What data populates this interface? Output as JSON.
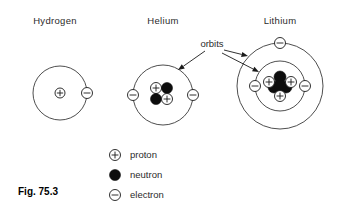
{
  "figure": {
    "caption": "Fig. 75.3",
    "orbits_label": "orbits",
    "width": 339,
    "height": 213,
    "colors": {
      "background": "#ffffff",
      "stroke": "#1a1a1a",
      "orbit_stroke": "#3a3a3a",
      "neutron_fill": "#0d0d0d",
      "proton_fill": "#ffffff",
      "electron_fill": "#ffffff",
      "text": "#2b2b2b"
    }
  },
  "atoms": [
    {
      "name": "hydrogen",
      "title": "Hydrogen",
      "title_x": 55,
      "title_y": 24,
      "center": {
        "x": 60,
        "y": 93
      },
      "orbits": [
        {
          "radius": 27
        }
      ],
      "protons": 1,
      "neutrons": 0,
      "electrons": 1,
      "nucleus_particles": [
        {
          "type": "proton",
          "dx": 0,
          "dy": 0,
          "r": 5
        }
      ],
      "electron_positions": [
        {
          "x": 87,
          "y": 93,
          "r": 5.5
        }
      ]
    },
    {
      "name": "helium",
      "title": "Helium",
      "title_x": 163,
      "title_y": 24,
      "center": {
        "x": 163,
        "y": 95
      },
      "orbits": [
        {
          "radius": 30
        }
      ],
      "protons": 2,
      "neutrons": 2,
      "electrons": 2,
      "nucleus_particles": [
        {
          "type": "proton",
          "dx": -7,
          "dy": -7,
          "r": 5.5
        },
        {
          "type": "neutron",
          "dx": 4,
          "dy": -7,
          "r": 5.5
        },
        {
          "type": "neutron",
          "dx": -7,
          "dy": 4,
          "r": 5.5
        },
        {
          "type": "proton",
          "dx": 4,
          "dy": 4,
          "r": 5.5
        }
      ],
      "electron_positions": [
        {
          "x": 133,
          "y": 95,
          "r": 5.5
        },
        {
          "x": 193,
          "y": 95,
          "r": 5.5
        }
      ]
    },
    {
      "name": "lithium",
      "title": "Lithium",
      "title_x": 280,
      "title_y": 24,
      "center": {
        "x": 280,
        "y": 86
      },
      "orbits": [
        {
          "radius": 25
        },
        {
          "radius": 43
        }
      ],
      "protons": 3,
      "neutrons": 4,
      "electrons": 3,
      "nucleus_particles": [
        {
          "type": "neutron",
          "dx": 0,
          "dy": -9,
          "r": 6
        },
        {
          "type": "neutron",
          "dx": -6,
          "dy": 1,
          "r": 6
        },
        {
          "type": "neutron",
          "dx": 6,
          "dy": 1,
          "r": 6
        },
        {
          "type": "neutron",
          "dx": 0,
          "dy": 0,
          "r": 6
        },
        {
          "type": "proton",
          "dx": -11,
          "dy": -4,
          "r": 5.5
        },
        {
          "type": "proton",
          "dx": 11,
          "dy": -4,
          "r": 5.5
        },
        {
          "type": "proton",
          "dx": 0,
          "dy": 10,
          "r": 5.5
        }
      ],
      "electron_positions": [
        {
          "x": 255,
          "y": 86,
          "r": 5.5
        },
        {
          "x": 305,
          "y": 86,
          "r": 5.5
        },
        {
          "x": 280,
          "y": 43,
          "r": 5.5
        }
      ]
    }
  ],
  "orbits_annotation": {
    "label": "orbits",
    "label_x": 212,
    "label_y": 47,
    "arrows": [
      {
        "name": "arrow-to-helium-orbit",
        "x1": 205,
        "y1": 51,
        "x2": 178,
        "y2": 70
      },
      {
        "name": "arrow-to-lithium-outer-orbit",
        "x1": 224,
        "y1": 50,
        "x2": 248,
        "y2": 56
      },
      {
        "name": "arrow-to-lithium-inner-orbit",
        "x1": 222,
        "y1": 53,
        "x2": 259,
        "y2": 72
      }
    ]
  },
  "legend": {
    "items": [
      {
        "symbol": "proton-symbol",
        "label": "proton",
        "x": 115,
        "y": 155
      },
      {
        "symbol": "neutron-symbol",
        "label": "neutron",
        "x": 115,
        "y": 175
      },
      {
        "symbol": "electron-symbol",
        "label": "electron",
        "x": 115,
        "y": 195
      }
    ],
    "text_x": 130
  },
  "caption": {
    "text": "Fig. 75.3",
    "x": 18,
    "y": 195
  }
}
